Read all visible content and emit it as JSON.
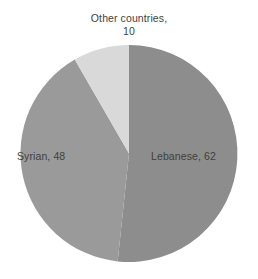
{
  "chart_data": {
    "type": "pie",
    "title": "",
    "categories": [
      "Lebanese",
      "Syrian",
      "Other countries"
    ],
    "values": [
      62,
      48,
      10
    ],
    "total": 120,
    "start_angle_deg": 0,
    "direction": "clockwise",
    "legend": "none",
    "labels_position": "outside-and-inside",
    "slice_colors": [
      "#8d8d8d",
      "#9a9a9a",
      "#d9d9d9"
    ],
    "slices": [
      {
        "name": "Lebanese",
        "value": 62,
        "label": "Lebanese, 62",
        "color": "#8d8d8d",
        "sweep_deg": 186
      },
      {
        "name": "Syrian",
        "value": 48,
        "label": "Syrian, 48",
        "color": "#9a9a9a",
        "sweep_deg": 144
      },
      {
        "name": "Other countries",
        "value": 10,
        "label_line1": "Other countries,",
        "label_line2": "10",
        "label": "Other countries, 10",
        "color": "#d9d9d9",
        "sweep_deg": 30
      }
    ]
  },
  "labels": {
    "other_countries_line1": "Other countries,",
    "other_countries_line2": "10",
    "lebanese": "Lebanese, 62",
    "syrian": "Syrian, 48"
  },
  "colors": {
    "background": "#ffffff",
    "text": "#3f3f3f",
    "lebanese_slice": "#8d8d8d",
    "syrian_slice": "#9a9a9a",
    "other_slice": "#d9d9d9"
  }
}
